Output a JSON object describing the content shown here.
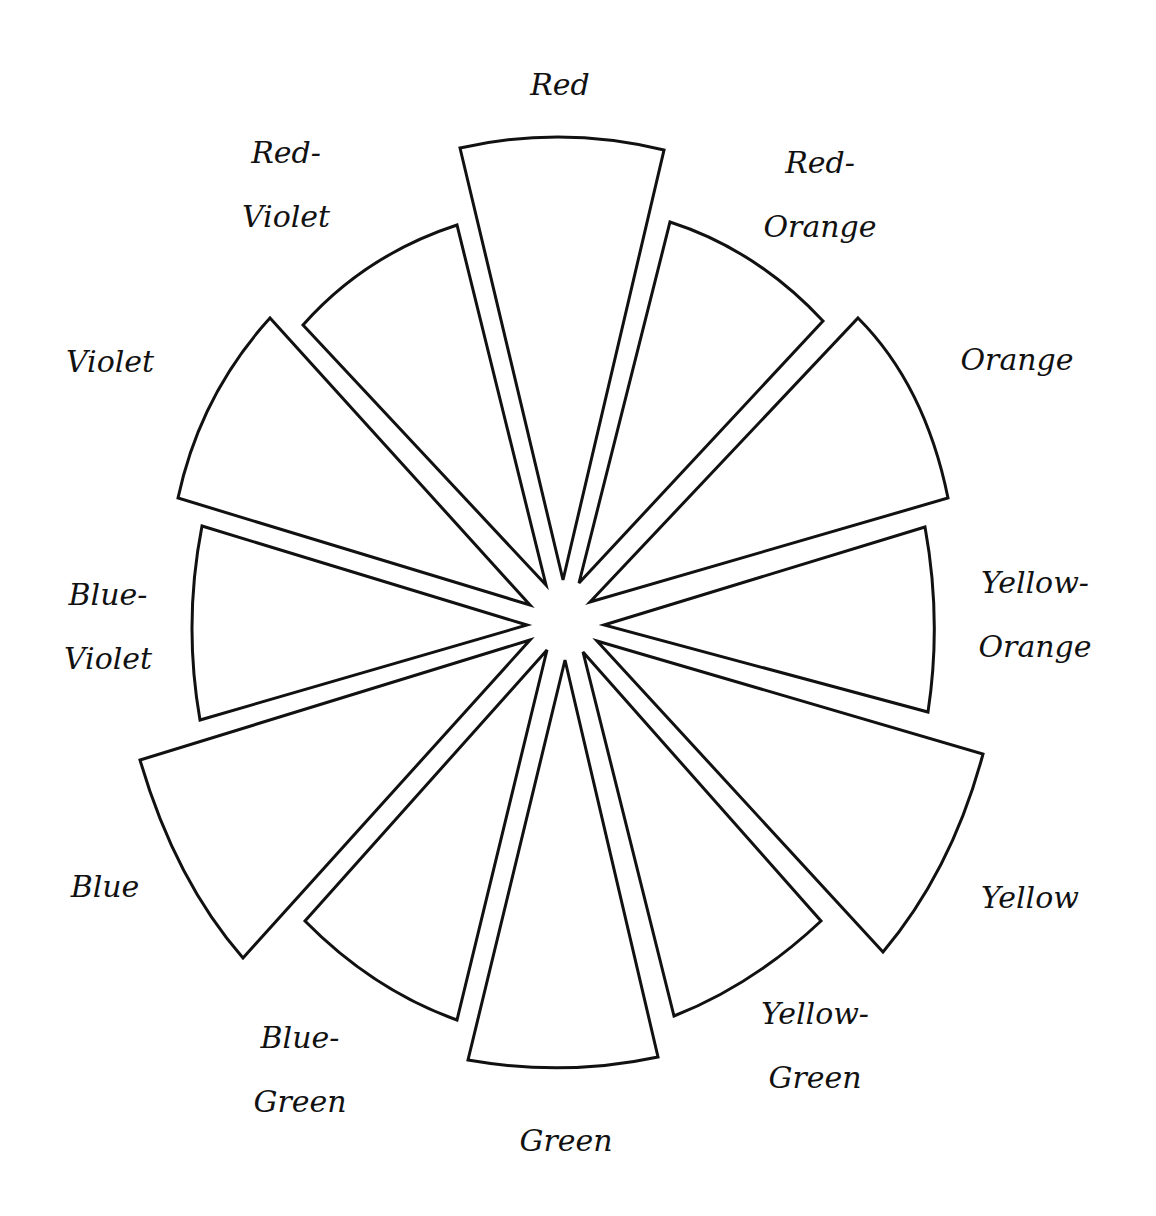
{
  "diagram": {
    "type": "color-wheel",
    "segment_count": 12,
    "stroke_color": "#111111",
    "fill_color": "#ffffff",
    "background_color": "#ffffff"
  },
  "segments": [
    {
      "name": "Red",
      "label_lines": [
        "Red"
      ],
      "label_pos": [
        560,
        85
      ],
      "path": "M563,580 L460,148 Q562,125 664,150 Z"
    },
    {
      "name": "Red-Orange",
      "label_lines": [
        "Red-",
        "Orange"
      ],
      "label_pos": [
        820,
        195
      ],
      "path": "M579,583 L670,222 Q757,250 823,321 Z"
    },
    {
      "name": "Orange",
      "label_lines": [
        "Orange"
      ],
      "label_pos": [
        1017,
        360
      ],
      "path": "M590,602 L858,318 Q925,385 948,498 Z"
    },
    {
      "name": "Yellow-Orange",
      "label_lines": [
        "Yellow-",
        "Orange"
      ],
      "label_pos": [
        1035,
        615
      ],
      "path": "M604,625 L925,527 Q942,620 928,712 Z"
    },
    {
      "name": "Yellow",
      "label_lines": [
        "Yellow"
      ],
      "label_pos": [
        1030,
        898
      ],
      "path": "M597,641 L983,754 Q952,870 883,952 Z"
    },
    {
      "name": "Yellow-Green",
      "label_lines": [
        "Yellow-",
        "Green"
      ],
      "label_pos": [
        815,
        1046
      ],
      "path": "M583,652 L821,921 Q753,985 674,1016 Z"
    },
    {
      "name": "Green",
      "label_lines": [
        "Green"
      ],
      "label_pos": [
        566,
        1141
      ],
      "path": "M565,660 L468,1060 Q565,1077 658,1057 Z"
    },
    {
      "name": "Blue-Green",
      "label_lines": [
        "Blue-",
        "Green"
      ],
      "label_pos": [
        300,
        1070
      ],
      "path": "M547,650 L305,921 Q373,990 457,1020 Z"
    },
    {
      "name": "Blue",
      "label_lines": [
        "Blue"
      ],
      "label_pos": [
        105,
        887
      ],
      "path": "M530,640 L140,760 Q175,880 243,958 Z"
    },
    {
      "name": "Blue-Violet",
      "label_lines": [
        "Blue-",
        "Violet"
      ],
      "label_pos": [
        108,
        627
      ],
      "path": "M527,625 L202,526 Q183,623 200,720 Z"
    },
    {
      "name": "Violet",
      "label_lines": [
        "Violet"
      ],
      "label_pos": [
        110,
        362
      ],
      "path": "M530,605 L270,318 Q200,395 178,498 Z"
    },
    {
      "name": "Red-Violet",
      "label_lines": [
        "Red-",
        "Violet"
      ],
      "label_pos": [
        286,
        185
      ],
      "path": "M546,585 L303,325 Q365,255 457,225 Z"
    }
  ]
}
